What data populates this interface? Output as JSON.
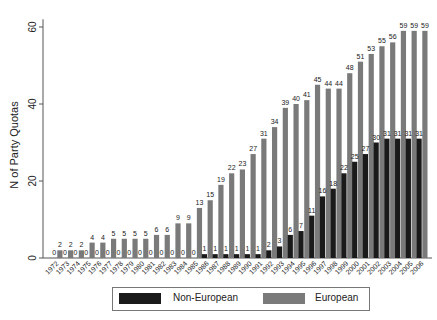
{
  "chart_data": {
    "type": "bar",
    "title": "",
    "xlabel": "",
    "ylabel": "N of Party Quotas",
    "ylim": [
      0,
      62
    ],
    "yticks": [
      0,
      20,
      40,
      60
    ],
    "grid": false,
    "legend_position": "bottom",
    "categories": [
      "1972",
      "1973",
      "1974",
      "1975",
      "1976",
      "1977",
      "1978",
      "1979",
      "1980",
      "1981",
      "1982",
      "1983",
      "1984",
      "1985",
      "1986",
      "1987",
      "1988",
      "1989",
      "1990",
      "1991",
      "1992",
      "1993",
      "1994",
      "1995",
      "1996",
      "1997",
      "1998",
      "1999",
      "2000",
      "2001",
      "2002",
      "2003",
      "2004",
      "2005",
      "2006"
    ],
    "series": [
      {
        "name": "Non-European",
        "color": "#1a1a1a",
        "values": [
          0,
          0,
          0,
          0,
          0,
          0,
          0,
          0,
          0,
          0,
          0,
          0,
          0,
          0,
          1,
          1,
          1,
          1,
          1,
          1,
          2,
          3,
          6,
          7,
          11,
          16,
          18,
          22,
          25,
          27,
          30,
          31,
          31,
          31,
          31
        ]
      },
      {
        "name": "European",
        "color": "#7a7a7a",
        "values": [
          2,
          2,
          2,
          4,
          4,
          5,
          5,
          5,
          5,
          6,
          6,
          9,
          9,
          13,
          15,
          19,
          22,
          23,
          27,
          31,
          34,
          39,
          40,
          41,
          45,
          44,
          44,
          48,
          51,
          53,
          55,
          56,
          59,
          59,
          59
        ]
      }
    ]
  },
  "legend": {
    "items": [
      {
        "label": "Non-European",
        "color": "#1a1a1a"
      },
      {
        "label": "European",
        "color": "#7a7a7a"
      }
    ]
  }
}
